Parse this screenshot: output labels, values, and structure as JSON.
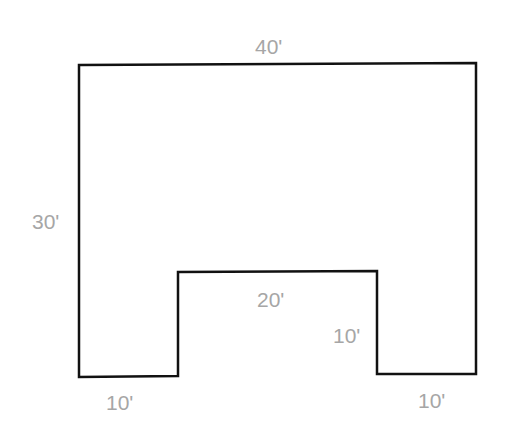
{
  "diagram": {
    "type": "floor-plan",
    "stroke_color": "#111111",
    "label_color": "#a6a6a6",
    "outline_points": [
      [
        79,
        65
      ],
      [
        476,
        63
      ],
      [
        476,
        374
      ],
      [
        377,
        374
      ],
      [
        377,
        271
      ],
      [
        178,
        272
      ],
      [
        178,
        376
      ],
      [
        79,
        377
      ]
    ],
    "labels": {
      "top_width": "40'",
      "left_height": "30'",
      "notch_width": "20'",
      "notch_depth": "10'",
      "bottom_left_width": "10'",
      "bottom_right_width": "10'"
    }
  }
}
